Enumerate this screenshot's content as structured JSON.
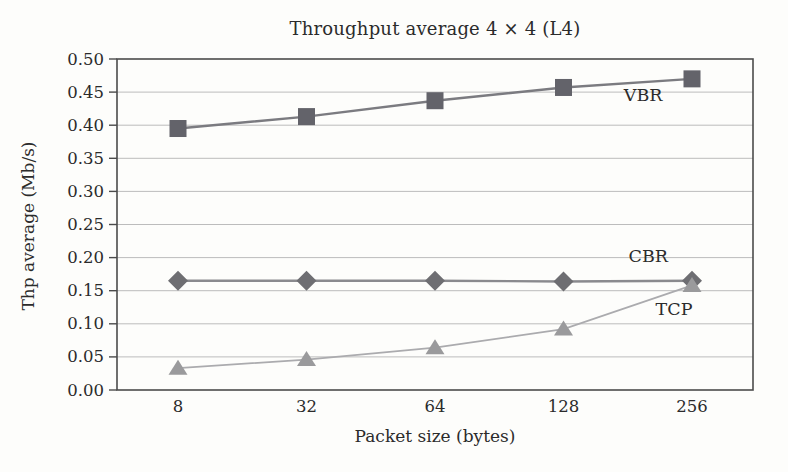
{
  "chart_data": {
    "type": "line",
    "title": "Throughput average 4 × 4 (L4)",
    "xlabel": "Packet size (bytes)",
    "ylabel": "Thp average (Mb/s)",
    "categories": [
      "8",
      "32",
      "64",
      "128",
      "256"
    ],
    "ylim": [
      0,
      0.5
    ],
    "ytick_step": 0.05,
    "ytick_labels": [
      "0.00",
      "0.05",
      "0.10",
      "0.15",
      "0.20",
      "0.25",
      "0.30",
      "0.35",
      "0.40",
      "0.45",
      "0.50"
    ],
    "grid": true,
    "legend_position": "inline-annotations",
    "colors": {
      "frame": "#4b4b4b",
      "gridline": "#bcbcbc",
      "background": "#fdfdfb",
      "text": "#2b2b2b"
    },
    "series": [
      {
        "name": "VBR",
        "marker": "square",
        "marker_color": "#63636a",
        "line_color": "#7b7b80",
        "values": [
          0.395,
          0.413,
          0.437,
          0.457,
          0.47
        ],
        "label": {
          "text": "VBR",
          "xi": 3.62,
          "y": 0.437
        }
      },
      {
        "name": "CBR",
        "marker": "diamond",
        "marker_color": "#6e6e72",
        "line_color": "#8a8a8e",
        "values": [
          0.165,
          0.165,
          0.165,
          0.164,
          0.165
        ],
        "label": {
          "text": "CBR",
          "xi": 3.66,
          "y": 0.193
        }
      },
      {
        "name": "TCP",
        "marker": "triangle",
        "marker_color": "#9a9a9c",
        "line_color": "#ababae",
        "values": [
          0.033,
          0.046,
          0.064,
          0.092,
          0.158
        ],
        "label": {
          "text": "TCP",
          "xi": 3.86,
          "y": 0.114
        }
      }
    ]
  }
}
